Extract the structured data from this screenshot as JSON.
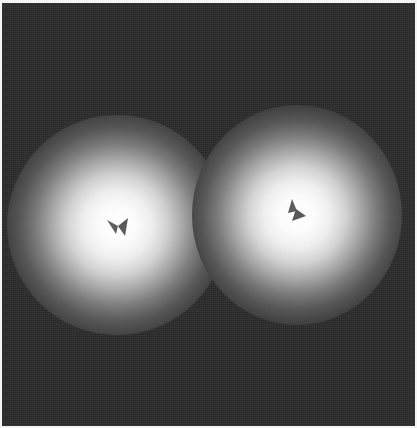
{
  "image": {
    "description": "Grayscale micrograph-like image with two bright radial glowing spots on a dark noisy background, each containing a small dark arrow-shaped mark near its center",
    "background_color": "#2a2a2a",
    "border_color": "#f4f4f4",
    "spots": [
      {
        "name": "left-spot",
        "center_x": 117,
        "center_y": 225,
        "mark_shape": "bow-tie / double arrowhead pointing left",
        "mark_color": "#5a5a5a"
      },
      {
        "name": "right-spot",
        "center_x": 297,
        "center_y": 215,
        "mark_shape": "stacked arrowheads pointing up-right",
        "mark_color": "#5a5a5a"
      }
    ]
  }
}
